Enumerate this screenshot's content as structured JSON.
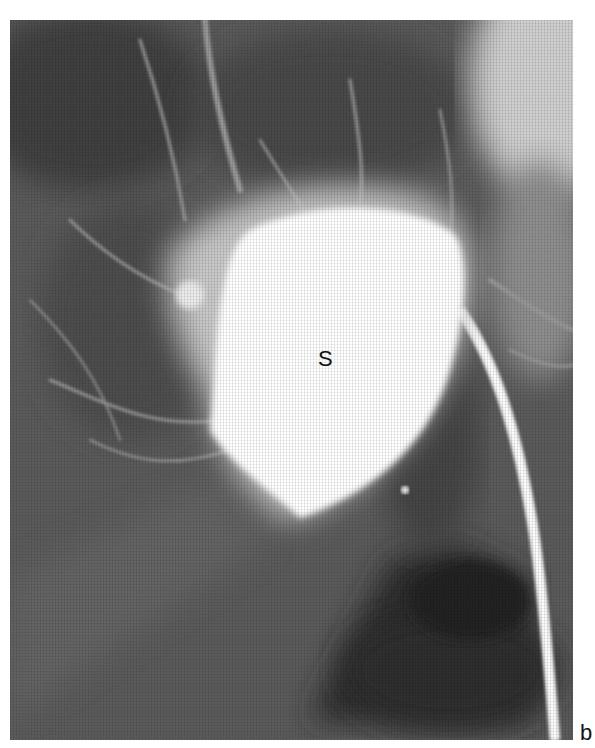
{
  "figure": {
    "type": "angiogram",
    "labels": {
      "structure": "S",
      "panel": "b"
    },
    "colors": {
      "background": "#5a5a5a",
      "contrast": "#ffffff",
      "dark_region": "#2e2e2e"
    }
  }
}
